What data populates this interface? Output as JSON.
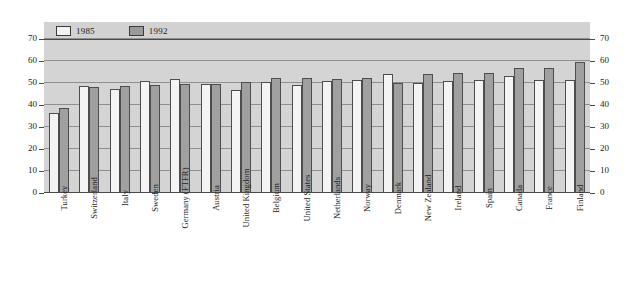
{
  "chart_data": {
    "type": "bar",
    "title": "",
    "subtitle": "",
    "xlabel": "",
    "ylabel": "",
    "ylim": [
      0,
      70
    ],
    "yticks": [
      0,
      10,
      20,
      30,
      40,
      50,
      60,
      70
    ],
    "grid": true,
    "legend_position": "top-left",
    "dual_y_axis": true,
    "categories": [
      "Turkey",
      "Switzerland",
      "Italy",
      "Sweden",
      "Germany (FTFR)",
      "Austria",
      "United Kingdom",
      "Belgium",
      "United States",
      "Netherlands",
      "Norway",
      "Denmark",
      "New Zealand",
      "Ireland",
      "Spain",
      "Canada",
      "France",
      "Finland"
    ],
    "series": [
      {
        "name": "1985",
        "color": "#f4f4f4",
        "values": [
          36.5,
          48.5,
          47.5,
          51,
          52,
          49.5,
          47,
          50.5,
          49,
          51,
          51.5,
          54,
          50,
          51,
          51.5,
          53,
          51.5,
          51.5
        ]
      },
      {
        "name": "1992",
        "color": "#a0a0a0",
        "values": [
          38.5,
          48,
          48.5,
          49,
          49.5,
          49.5,
          50.5,
          52.5,
          52.5,
          52,
          52.5,
          50,
          54,
          54.5,
          54.5,
          57,
          57,
          59.5
        ]
      }
    ]
  },
  "legend": {
    "items": [
      {
        "label": "1985",
        "swatch": "legend-swatch-1985"
      },
      {
        "label": "1992",
        "swatch": "legend-swatch-1992"
      }
    ]
  },
  "axes": {
    "left_ticks": [
      "70",
      "60",
      "50",
      "40",
      "30",
      "20",
      "10",
      "0"
    ],
    "right_ticks": [
      "70",
      "60",
      "50",
      "40",
      "30",
      "20",
      "10",
      "0"
    ]
  },
  "colors": {
    "plot_background": "#d4d4d4",
    "legend_background": "#d2d2d2",
    "gridline": "#8f8f8f",
    "axis": "#4a4a4a",
    "bar_1985": "#f4f4f4",
    "bar_1992": "#a0a0a0",
    "text": "#1c1c1c"
  }
}
